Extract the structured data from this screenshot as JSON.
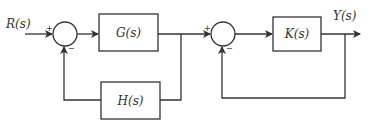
{
  "diagram": {
    "type": "block-diagram",
    "input_label": "R(s)",
    "output_label": "Y(s)",
    "blocks": {
      "g": {
        "label": "G(s)"
      },
      "h": {
        "label": "H(s)"
      },
      "k": {
        "label": "K(s)"
      }
    },
    "summing_junctions": {
      "s1": {
        "plus": "+",
        "minus": "−"
      },
      "s2": {
        "plus": "+",
        "minus": "−"
      }
    },
    "colors": {
      "stroke": "#333333",
      "background": "#ffffff"
    }
  }
}
